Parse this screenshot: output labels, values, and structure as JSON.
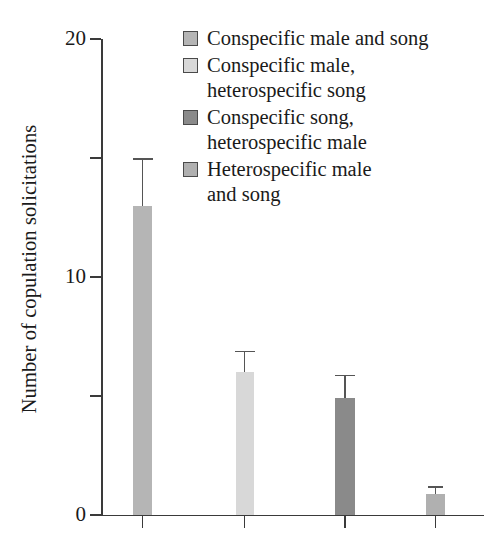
{
  "chart_data": {
    "type": "bar",
    "title": "",
    "xlabel": "",
    "ylabel": "Number of copulation solicitations",
    "ylim": [
      0,
      20
    ],
    "yticks": [
      0,
      5,
      10,
      15,
      20
    ],
    "ytick_labels": [
      "0",
      "",
      "10",
      "",
      "20"
    ],
    "grid": false,
    "legend_position": "top-right",
    "categories": [
      "Conspecific male and song",
      "Conspecific male, heterospecific song",
      "Conspecific song, heterospecific male",
      "Heterospecific male and song"
    ],
    "values": [
      13.0,
      6.0,
      4.9,
      0.9
    ],
    "errors_upper": [
      15.0,
      6.9,
      5.9,
      1.2
    ],
    "error_bars": [
      2.0,
      0.9,
      1.0,
      0.3
    ],
    "bar_colors": [
      "#b5b5b5",
      "#d8d8d8",
      "#8a8a8a",
      "#b0b0b0"
    ],
    "series": [
      {
        "name": "Number of copulation solicitations",
        "values": [
          13.0,
          6.0,
          4.9,
          0.9
        ]
      }
    ]
  },
  "axes": {
    "y_title": "Number of copulation solicitations",
    "tick_20": "20",
    "tick_10": "10",
    "tick_0": "0"
  },
  "legend": {
    "items": [
      {
        "label": "Conspecific male and song",
        "color": "#b5b5b5"
      },
      {
        "label": "Conspecific male,\nheterospecific song",
        "color": "#d8d8d8"
      },
      {
        "label": "Conspecific song,\nheterospecific male",
        "color": "#8a8a8a"
      },
      {
        "label": "Heterospecific male\nand song",
        "color": "#b0b0b0"
      }
    ]
  }
}
